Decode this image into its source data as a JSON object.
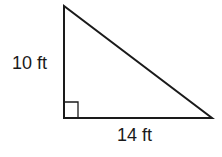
{
  "diagram": {
    "type": "right-triangle",
    "labels": {
      "vertical_leg": "10 ft",
      "horizontal_leg": "14 ft"
    },
    "right_angle_marker": true,
    "stroke_color": "#1a1a1a",
    "background": "#ffffff"
  }
}
